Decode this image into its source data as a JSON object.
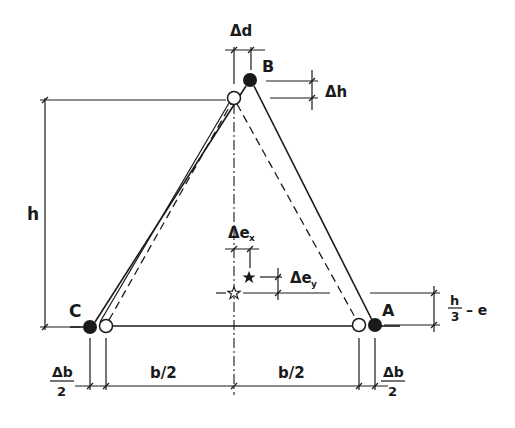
{
  "diagram": {
    "type": "engineering-sketch",
    "nodes": {
      "A": {
        "label": "A",
        "filled": [
          375,
          325
        ],
        "open": [
          359,
          325
        ]
      },
      "B": {
        "label": "B",
        "filled": [
          250,
          80
        ],
        "open": [
          234,
          98
        ]
      },
      "C": {
        "label": "C",
        "filled": [
          90,
          327
        ],
        "open": [
          106,
          326
        ]
      }
    },
    "labels": {
      "delta_d": "Δd",
      "delta_h": "Δh",
      "h": "h",
      "delta_ex": "Δe",
      "delta_ex_sub": "x",
      "delta_ey": "Δe",
      "delta_ey_sub": "y",
      "h_over_3_num": "h",
      "h_over_3_den": "3",
      "minus_e": "– e",
      "b_half_left": "b/2",
      "b_half_right": "b/2",
      "delta_b_left_num": "Δb",
      "delta_b_left_den": "2",
      "delta_b_right_num": "Δb",
      "delta_b_right_den": "2"
    },
    "colors": {
      "ink": "#1a1a1a",
      "background": "#ffffff"
    }
  }
}
